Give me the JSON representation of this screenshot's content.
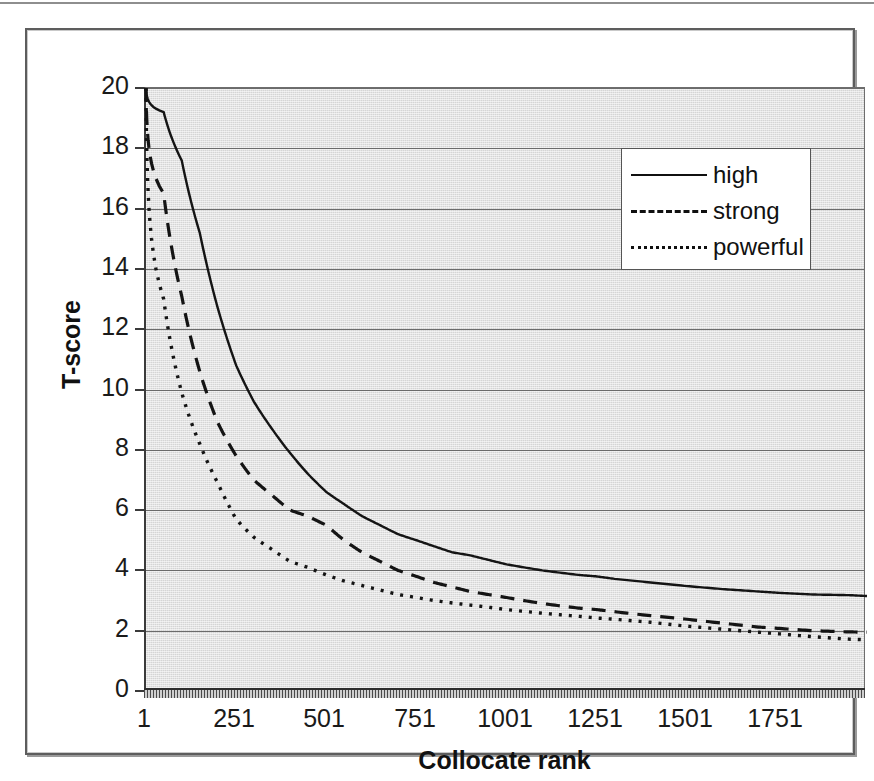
{
  "figure": {
    "type": "line-chart",
    "background_color": "#d5d5d5",
    "frame_color": "#5d5d5d"
  },
  "axes": {
    "y_title": "T-score",
    "x_title": "Collocate rank",
    "y_ticks": [
      "20",
      "18",
      "16",
      "14",
      "12",
      "10",
      "8",
      "6",
      "4",
      "2",
      "0"
    ],
    "x_ticks": [
      "1",
      "251",
      "501",
      "751",
      "1001",
      "1251",
      "1501",
      "1751"
    ]
  },
  "legend": {
    "position": "top-right-inside",
    "items": [
      {
        "label": "high",
        "style": "solid",
        "color": "#101010"
      },
      {
        "label": "strong",
        "style": "dashed",
        "color": "#101010"
      },
      {
        "label": "powerful",
        "style": "dotted",
        "color": "#101010"
      }
    ]
  },
  "chart_data": {
    "type": "line",
    "title": "",
    "subtitle": "",
    "xlabel": "Collocate rank",
    "ylabel": "T-score",
    "xlim": [
      1,
      2000
    ],
    "ylim": [
      0,
      20
    ],
    "ytick_step": 2,
    "xtick_step": 250,
    "grid": "horizontal",
    "legend_position": "top-right-inside",
    "annotations": [],
    "x": [
      1,
      50,
      100,
      150,
      200,
      251,
      300,
      350,
      400,
      450,
      501,
      550,
      600,
      650,
      700,
      751,
      800,
      850,
      900,
      950,
      1001,
      1100,
      1200,
      1251,
      1300,
      1400,
      1501,
      1600,
      1700,
      1751,
      1850,
      1950,
      2000
    ],
    "series": [
      {
        "name": "high",
        "style": "solid",
        "values": [
          20.0,
          19.2,
          17.6,
          15.2,
          12.7,
          10.8,
          9.6,
          8.7,
          7.9,
          7.2,
          6.6,
          6.2,
          5.8,
          5.5,
          5.2,
          5.0,
          4.8,
          4.6,
          4.5,
          4.35,
          4.2,
          4.0,
          3.85,
          3.8,
          3.72,
          3.6,
          3.48,
          3.38,
          3.3,
          3.26,
          3.2,
          3.18,
          3.15
        ]
      },
      {
        "name": "strong",
        "style": "dashed",
        "values": [
          20.0,
          16.5,
          13.1,
          10.6,
          8.9,
          7.8,
          7.0,
          6.5,
          6.0,
          5.8,
          5.5,
          5.0,
          4.6,
          4.3,
          4.0,
          3.8,
          3.6,
          3.45,
          3.3,
          3.2,
          3.1,
          2.9,
          2.75,
          2.7,
          2.63,
          2.5,
          2.38,
          2.25,
          2.12,
          2.08,
          2.0,
          1.96,
          1.95
        ]
      },
      {
        "name": "powerful",
        "style": "dotted",
        "values": [
          20.0,
          13.0,
          9.9,
          8.2,
          6.9,
          5.7,
          5.1,
          4.7,
          4.3,
          4.1,
          3.85,
          3.65,
          3.5,
          3.35,
          3.2,
          3.1,
          3.0,
          2.92,
          2.85,
          2.78,
          2.7,
          2.58,
          2.48,
          2.42,
          2.38,
          2.28,
          2.15,
          2.05,
          1.95,
          1.9,
          1.8,
          1.72,
          1.7
        ]
      }
    ]
  }
}
